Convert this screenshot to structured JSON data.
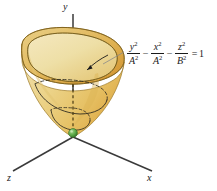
{
  "figure": {
    "type": "3d-surface-diagram",
    "background_color": "#ffffff"
  },
  "axes": {
    "y": {
      "label": "y",
      "orientation": "vertical-up",
      "color": "#3a3a3a"
    },
    "x": {
      "label": "x",
      "orientation": "lower-right",
      "color": "#3a3a3a"
    },
    "z": {
      "label": "z",
      "orientation": "lower-left",
      "color": "#3a3a3a"
    }
  },
  "equation": {
    "term1_num": "y",
    "term1_den": "A",
    "term2_num": "x",
    "term2_den": "A",
    "term3_num": "z",
    "term3_den": "B",
    "exponent": "2",
    "op1": "−",
    "op2": "−",
    "equals": "=",
    "rhs": "1",
    "plain": "y²/A² − x²/A² − z²/B² = 1"
  },
  "surface": {
    "name": "hyperboloid-sheet",
    "fill_light": "#f2e2b0",
    "fill_mid": "#e8c96f",
    "fill_dark": "#d9a23c",
    "outline_color": "#8a6a22",
    "rim_color": "#6b5516"
  },
  "vertex_point": {
    "name": "vertex",
    "color": "#4e9b3e",
    "highlight": "#8fd07a"
  },
  "annotations": {
    "leader_line_color": "#7a7a7a",
    "arrow_color": "#1a1a1a",
    "cross_section_color": "#2a2a2a",
    "dashed_color": "#2a2a2a"
  }
}
